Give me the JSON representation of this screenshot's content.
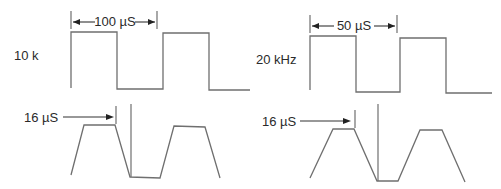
{
  "figure": {
    "type": "waveform-diagram",
    "panels": [
      {
        "id": "left",
        "frequency_label": "10 k",
        "period_label": "100 µS",
        "rise_time_label": "16 µS",
        "square_wave_points": "71,88 71,32 117,32 117,89 163,89 163,33 209,33 209,90 250,90",
        "trapezoid_wave_points": "71,175 84,125 115,125 130,177 160,178 174,126 205,127 220,178"
      },
      {
        "id": "right",
        "frequency_label": "20 kHz",
        "period_label": "50 µS",
        "rise_time_label": "16 µS",
        "square_wave_points": "310,90 310,36 356,36 356,92 400,92 400,38 446,38 446,93 492,93",
        "trapezoid_wave_points": "310,178 333,129 354,129 377,181 398,181 420,130 442,130 465,182"
      }
    ],
    "colors": {
      "waveform": "#6f6f6f",
      "text": "#2a2a2a",
      "arrow": "#222222",
      "background": "#ffffff"
    }
  }
}
